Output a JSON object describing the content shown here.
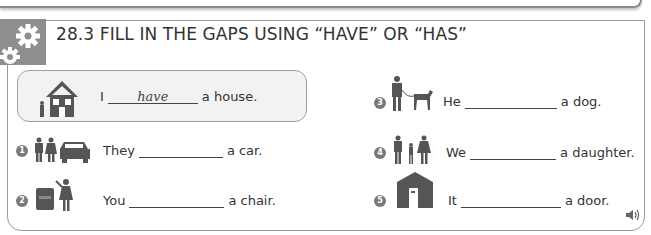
{
  "exercise": {
    "number": "28.3",
    "title": "28.3  FILL IN THE GAPS USING “HAVE” OR “HAS”",
    "badge_icon": "gears-icon"
  },
  "example": {
    "icon": "house-with-person-icon",
    "subject": "I",
    "answer": "have",
    "ending": "a house."
  },
  "items": [
    {
      "number": "1",
      "icon": "couple-with-car-icon",
      "subject": "They",
      "answer": "",
      "ending": "a car."
    },
    {
      "number": "2",
      "icon": "woman-with-armchair-icon",
      "subject": "You",
      "answer": "",
      "ending": "a chair."
    },
    {
      "number": "3",
      "icon": "man-with-dog-icon",
      "subject": "He",
      "answer": "",
      "ending": "a dog."
    },
    {
      "number": "4",
      "icon": "family-with-daughter-icon",
      "subject": "We",
      "answer": "",
      "ending": "a daughter."
    },
    {
      "number": "5",
      "icon": "building-with-door-icon",
      "subject": "It",
      "answer": "",
      "ending": "a door."
    }
  ],
  "audio": {
    "icon": "speaker-icon"
  },
  "colors": {
    "badge": "#8e8e8e",
    "border": "#9a9a9a",
    "example_bg": "#f2f2f2",
    "icon": "#555555"
  }
}
